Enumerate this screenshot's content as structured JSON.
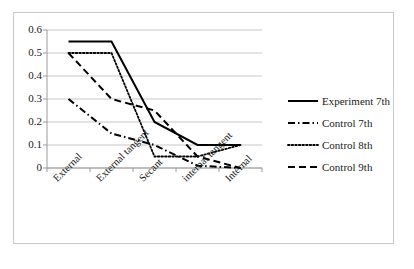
{
  "chart_data": {
    "type": "line",
    "title": "",
    "xlabel": "",
    "ylabel": "",
    "categories": [
      "External",
      "External tangent",
      "Secant",
      "internal tangent",
      "Internal"
    ],
    "ytick_labels": [
      "0.6",
      "0.5",
      "0.4",
      "0.3",
      "0.2",
      "0.1",
      "0"
    ],
    "yticks": [
      0.6,
      0.5,
      0.4,
      0.3,
      0.2,
      0.1,
      0
    ],
    "ylim": [
      0,
      0.6
    ],
    "grid": "horizontal",
    "legend_position": "right",
    "series": [
      {
        "name": "Experiment 7th",
        "style": "solid",
        "color": "#000000",
        "values": [
          0.55,
          0.55,
          0.2,
          0.1,
          0.1
        ]
      },
      {
        "name": "Control 7th",
        "style": "dash-dot",
        "color": "#000000",
        "values": [
          0.3,
          0.15,
          0.1,
          0.01,
          0.0
        ]
      },
      {
        "name": "Control 8th",
        "style": "dotted",
        "color": "#000000",
        "values": [
          0.5,
          0.5,
          0.05,
          0.05,
          0.1
        ]
      },
      {
        "name": "Control 9th",
        "style": "dashed",
        "color": "#000000",
        "values": [
          0.5,
          0.3,
          0.25,
          0.05,
          0.0
        ]
      }
    ]
  },
  "legend": {
    "items": [
      {
        "label": "Experiment 7th"
      },
      {
        "label": "Control 7th"
      },
      {
        "label": "Control 8th"
      },
      {
        "label": "Control 9th"
      }
    ]
  },
  "axis": {
    "y_labels": [
      "0.6",
      "0.5",
      "0.4",
      "0.3",
      "0.2",
      "0.1",
      "0"
    ],
    "x_labels": [
      "External",
      "External tangent",
      "Secant",
      "internal tangent",
      "Internal"
    ]
  },
  "colors": {
    "line": "#000000",
    "grid": "#b9b9b9",
    "axis": "#9a9a9a",
    "border": "#c9c9c9",
    "background": "#ffffff",
    "text": "#1a1a1a"
  }
}
